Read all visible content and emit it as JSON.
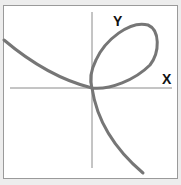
{
  "diagram": {
    "x_axis_label": "X",
    "y_axis_label": "Y",
    "colors": {
      "background": "#ededed",
      "frame_fill": "#ffffff",
      "frame_border": "#9a9a9a",
      "axis": "#8a8a8a",
      "curve": "#767676",
      "label": "#111111"
    }
  }
}
